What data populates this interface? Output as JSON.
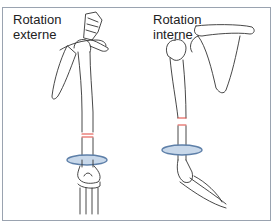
{
  "figure": {
    "panels": [
      {
        "id": "external",
        "label_line1": "Rotation",
        "label_line2": "externe",
        "anatomy": "right shoulder (scapula, humerus) with elbow shown externally rotated"
      },
      {
        "id": "internal",
        "label_line1": "Rotation",
        "label_line2": "interne",
        "anatomy": "right shoulder (clavicle, scapula, humerus) with forearm internally rotated"
      }
    ],
    "colors": {
      "bone_outline": "#333333",
      "cut_marks": "#e0443c",
      "rotation_arrow_fill": "#a9c1dd",
      "rotation_arrow_stroke": "#5d7fa8",
      "frame_border": "#9aa3b0"
    }
  }
}
